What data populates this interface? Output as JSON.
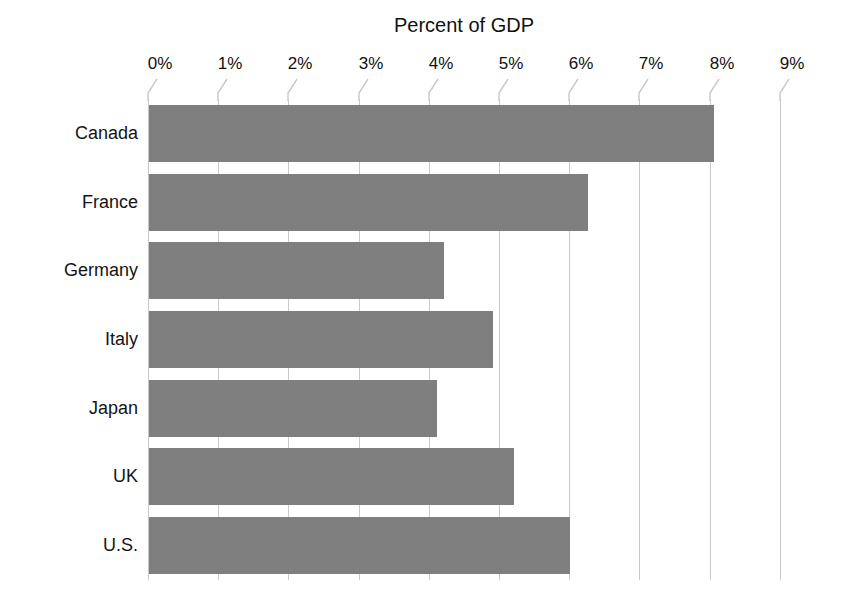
{
  "chart_data": {
    "type": "bar",
    "orientation": "horizontal",
    "title": "Percent of GDP",
    "xlabel": "",
    "ylabel": "",
    "categories": [
      "Canada",
      "France",
      "Germany",
      "Italy",
      "Japan",
      "UK",
      "U.S."
    ],
    "values": [
      8.05,
      6.25,
      4.2,
      4.9,
      4.1,
      5.2,
      6.0
    ],
    "series": [
      {
        "name": "Percent of GDP",
        "values": [
          8.05,
          6.25,
          4.2,
          4.9,
          4.1,
          5.2,
          6.0
        ]
      }
    ],
    "xlim": [
      0,
      9
    ],
    "xticks": [
      0,
      1,
      2,
      3,
      4,
      5,
      6,
      7,
      8,
      9
    ],
    "xtick_labels": [
      "0%",
      "1%",
      "2%",
      "3%",
      "4%",
      "5%",
      "6%",
      "7%",
      "8%",
      "9%"
    ],
    "grid": true,
    "grid_axis": "x",
    "legend": false,
    "bar_color": "#7f7f7f",
    "grid_color": "#c9c9c9",
    "background_color": "#ffffff"
  }
}
